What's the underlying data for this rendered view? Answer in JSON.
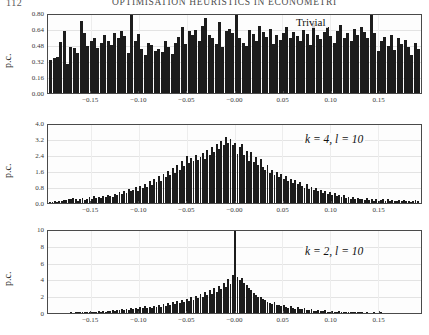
{
  "page": {
    "folio": "112",
    "running_head": "OPTIMISATION HEURISTICS IN ECONOMETRI"
  },
  "chart_data": [
    {
      "type": "bar",
      "title": "",
      "annotation": "Trivial",
      "xlabel": "",
      "ylabel": "p.c.",
      "xlim": [
        -0.195,
        0.195
      ],
      "ylim": [
        0.0,
        0.8
      ],
      "yticks": [
        "0.00",
        "0.16",
        "0.32",
        "0.48",
        "0.64",
        "0.80"
      ],
      "ytick_values": [
        0.0,
        0.16,
        0.32,
        0.48,
        0.64,
        0.8
      ],
      "xticks": [
        "-0.15",
        "-0.10",
        "-0.05",
        "-0.00",
        "0.05",
        "0.10",
        "0.15"
      ],
      "xtick_values": [
        -0.15,
        -0.1,
        -0.05,
        0.0,
        0.05,
        0.1,
        0.15
      ],
      "grid": true,
      "legend": "none",
      "values": [
        0.33,
        0.35,
        0.36,
        0.51,
        0.62,
        0.29,
        0.46,
        0.45,
        0.4,
        0.72,
        0.6,
        0.47,
        0.52,
        0.55,
        0.45,
        0.5,
        0.58,
        0.52,
        0.48,
        0.6,
        0.55,
        0.62,
        0.57,
        0.4,
        0.79,
        0.52,
        0.59,
        0.44,
        0.38,
        0.5,
        0.48,
        0.42,
        0.44,
        0.41,
        0.52,
        0.46,
        0.39,
        0.5,
        0.56,
        0.66,
        0.49,
        0.62,
        0.58,
        0.63,
        0.52,
        0.67,
        0.75,
        0.58,
        0.55,
        0.49,
        0.71,
        0.46,
        0.62,
        0.64,
        0.6,
        0.78,
        0.55,
        0.5,
        0.47,
        0.63,
        0.59,
        0.52,
        0.67,
        0.61,
        0.56,
        0.64,
        0.49,
        0.58,
        0.53,
        0.6,
        0.66,
        0.55,
        0.61,
        0.57,
        0.52,
        0.63,
        0.59,
        0.48,
        0.7,
        0.58,
        0.54,
        0.61,
        0.66,
        0.57,
        0.5,
        0.62,
        0.68,
        0.55,
        0.6,
        0.52,
        0.64,
        0.58,
        0.66,
        0.61,
        0.55,
        0.78,
        0.6,
        0.42,
        0.52,
        0.56,
        0.47,
        0.58,
        0.43,
        0.55,
        0.49,
        0.53,
        0.46,
        0.38,
        0.5,
        0.44
      ]
    },
    {
      "type": "bar",
      "title": "",
      "annotation": "k = 4, l = 10",
      "xlabel": "",
      "ylabel": "p.c.",
      "xlim": [
        -0.195,
        0.195
      ],
      "ylim": [
        0.0,
        4.0
      ],
      "yticks": [
        "0.0",
        "0.8",
        "1.6",
        "2.4",
        "3.2",
        "4.0"
      ],
      "ytick_values": [
        0.0,
        0.8,
        1.6,
        2.4,
        3.2,
        4.0
      ],
      "xticks": [
        "-0.15",
        "-0.10",
        "-0.05",
        "-0.00",
        "0.05",
        "0.10",
        "0.15"
      ],
      "xtick_values": [
        -0.15,
        -0.1,
        -0.05,
        0.0,
        0.05,
        0.1,
        0.15
      ],
      "grid": true,
      "legend": "none",
      "values": [
        0.04,
        0.05,
        0.08,
        0.06,
        0.12,
        0.1,
        0.16,
        0.14,
        0.2,
        0.18,
        0.26,
        0.22,
        0.12,
        0.18,
        0.24,
        0.16,
        0.22,
        0.28,
        0.2,
        0.34,
        0.26,
        0.3,
        0.24,
        0.36,
        0.3,
        0.42,
        0.34,
        0.3,
        0.46,
        0.38,
        0.56,
        0.44,
        0.62,
        0.52,
        0.7,
        0.58,
        0.66,
        0.78,
        0.62,
        0.86,
        0.74,
        0.96,
        0.82,
        1.1,
        0.92,
        1.22,
        1.05,
        1.34,
        1.12,
        1.46,
        1.28,
        1.58,
        1.38,
        1.74,
        1.52,
        1.9,
        1.66,
        2.12,
        1.84,
        2.34,
        2.02,
        2.26,
        2.08,
        2.42,
        2.16,
        2.3,
        2.5,
        2.22,
        2.64,
        2.4,
        2.8,
        2.56,
        2.96,
        2.7,
        3.1,
        2.88,
        3.3,
        3.02,
        3.18,
        2.9,
        3.0,
        2.46,
        2.78,
        2.94,
        2.4,
        2.62,
        2.1,
        2.56,
        2.04,
        2.3,
        1.92,
        2.18,
        1.8,
        1.64,
        1.9,
        1.52,
        1.66,
        1.42,
        1.56,
        1.3,
        1.44,
        1.2,
        1.34,
        1.1,
        1.22,
        1.02,
        1.14,
        0.94,
        1.06,
        0.86,
        0.74,
        0.96,
        0.7,
        0.82,
        0.64,
        0.74,
        0.58,
        0.66,
        0.52,
        0.6,
        0.46,
        0.54,
        0.4,
        0.48,
        0.36,
        0.42,
        0.3,
        0.38,
        0.26,
        0.32,
        0.22,
        0.28,
        0.2,
        0.24,
        0.18,
        0.22,
        0.16,
        0.26,
        0.14,
        0.2,
        0.12,
        0.18,
        0.1,
        0.16,
        0.22,
        0.12,
        0.18,
        0.1,
        0.14,
        0.08,
        0.12,
        0.16,
        0.1,
        0.14,
        0.08,
        0.12,
        0.06,
        0.1,
        0.14,
        0.08
      ]
    },
    {
      "type": "bar",
      "title": "",
      "annotation": "k = 2, l = 10",
      "xlabel": "",
      "ylabel": "p.c.",
      "xlim": [
        -0.195,
        0.195
      ],
      "ylim": [
        0,
        10
      ],
      "yticks": [
        "0",
        "2",
        "4",
        "6",
        "8",
        "10"
      ],
      "ytick_values": [
        0,
        2,
        4,
        6,
        8,
        10
      ],
      "xticks": [
        "-0.15",
        "-0.10",
        "-0.05",
        "-0.00",
        "0.05",
        "0.10",
        "0.15"
      ],
      "xtick_values": [
        -0.15,
        -0.1,
        -0.05,
        0.0,
        0.05,
        0.1,
        0.15
      ],
      "grid": true,
      "legend": "none",
      "values": [
        0.02,
        0.03,
        0.02,
        0.04,
        0.03,
        0.05,
        0.04,
        0.06,
        0.05,
        0.08,
        0.06,
        0.1,
        0.08,
        0.12,
        0.09,
        0.14,
        0.11,
        0.16,
        0.13,
        0.18,
        0.14,
        0.2,
        0.16,
        0.24,
        0.18,
        0.28,
        0.22,
        0.32,
        0.26,
        0.36,
        0.3,
        0.42,
        0.34,
        0.48,
        0.38,
        0.55,
        0.44,
        0.62,
        0.5,
        0.7,
        0.56,
        0.8,
        0.64,
        0.72,
        0.58,
        0.86,
        0.68,
        0.94,
        0.76,
        1.05,
        0.86,
        1.16,
        0.96,
        1.3,
        1.08,
        1.42,
        1.2,
        1.56,
        1.32,
        1.7,
        1.46,
        1.88,
        1.6,
        2.05,
        1.76,
        2.24,
        1.94,
        2.46,
        2.1,
        2.7,
        2.3,
        2.95,
        2.52,
        3.25,
        2.8,
        3.6,
        3.1,
        4.0,
        3.4,
        4.55,
        10.0,
        4.3,
        3.9,
        4.15,
        3.6,
        3.3,
        3.0,
        2.7,
        2.4,
        2.15,
        1.9,
        1.95,
        1.7,
        1.5,
        1.35,
        1.2,
        1.08,
        1.3,
        1.0,
        0.9,
        0.8,
        0.95,
        0.72,
        0.65,
        0.85,
        0.58,
        0.52,
        0.7,
        0.46,
        0.42,
        0.58,
        0.36,
        0.32,
        0.46,
        0.28,
        0.25,
        0.38,
        0.22,
        0.2,
        0.3,
        0.18,
        0.16,
        0.24,
        0.14,
        0.13,
        0.2,
        0.12,
        0.11,
        0.17,
        0.1,
        0.09,
        0.14,
        0.08,
        0.07,
        0.12,
        0.07,
        0.06,
        0.1,
        0.05,
        0.05,
        0.08,
        0.04,
        0.04,
        0.07,
        0.03,
        0.03,
        0.05,
        0.03,
        0.02,
        0.04,
        0.02,
        0.02,
        0.03,
        0.02,
        0.01,
        0.02,
        0.01,
        0.01,
        0.02,
        0.01
      ]
    }
  ]
}
